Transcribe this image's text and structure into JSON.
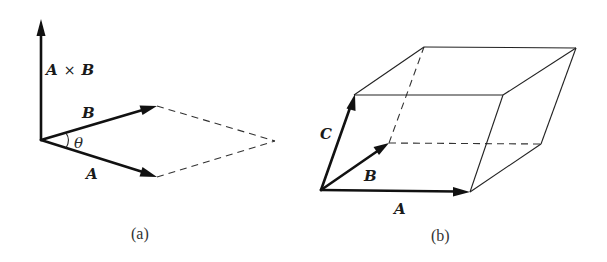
{
  "figure_a": {
    "caption": "(a)",
    "labels": {
      "cross_product_left": "A",
      "cross_product_times": "×",
      "cross_product_right": "B",
      "vector_b": "B",
      "vector_a": "A",
      "angle": "θ"
    },
    "elements": {
      "vectors": [
        "A",
        "B",
        "A × B"
      ],
      "dashed_parallelogram": "completes parallelogram spanned by A and B",
      "angle_between": "θ between A and B"
    }
  },
  "figure_b": {
    "caption": "(b)",
    "labels": {
      "vector_a": "A",
      "vector_b": "B",
      "vector_c": "C"
    },
    "elements": {
      "vectors": [
        "A",
        "B",
        "C"
      ],
      "shape": "parallelepiped spanned by A, B, C with hidden edges dashed"
    }
  },
  "colors": {
    "ink": "#111111",
    "background": "#ffffff"
  }
}
